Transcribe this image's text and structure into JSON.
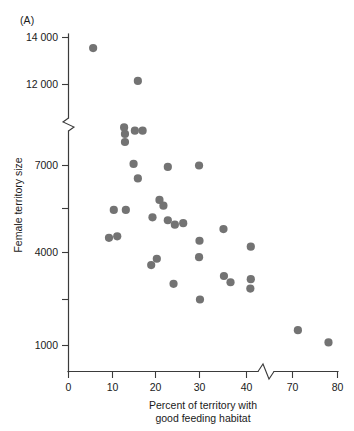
{
  "figure": {
    "panel_label": "(A)",
    "background_color": "#ffffff",
    "point_color": "#737373",
    "axis_color": "#3b3b3b"
  },
  "chart_data": {
    "type": "scatter",
    "title": "",
    "panel": "(A)",
    "xlabel": "Percent of territory with good feeding habitat",
    "xlabel_line1": "Percent of territory with",
    "xlabel_line2": "good feeding habitat",
    "ylabel": "Female territory size",
    "xlim": [
      0,
      80
    ],
    "ylim": [
      1000,
      14000
    ],
    "grid": false,
    "legend": null,
    "x_ticks": [
      0,
      10,
      20,
      30,
      40,
      70,
      80
    ],
    "x_tick_labels": [
      "0",
      "10",
      "20",
      "30",
      "40",
      "70",
      "80"
    ],
    "y_ticks": [
      1000,
      4000,
      7000,
      12000,
      14000
    ],
    "y_tick_labels": [
      "1000",
      "4000",
      "7000",
      "12 000",
      "14 000"
    ],
    "y_minor_ticks": [
      2500,
      5500
    ],
    "axis_break_x": {
      "between": [
        40,
        70
      ],
      "at": 45
    },
    "axis_break_y": {
      "between": [
        7000,
        12000
      ],
      "at": 9500
    },
    "marker": "circle",
    "marker_size": 5.2,
    "points": [
      {
        "x": 5.6,
        "y": 13550
      },
      {
        "x": 15.9,
        "y": 12150
      },
      {
        "x": 12.7,
        "y": 9350
      },
      {
        "x": 12.9,
        "y": 8950
      },
      {
        "x": 15.2,
        "y": 9150
      },
      {
        "x": 17.0,
        "y": 9150
      },
      {
        "x": 12.9,
        "y": 8450
      },
      {
        "x": 14.9,
        "y": 7100
      },
      {
        "x": 15.9,
        "y": 6550
      },
      {
        "x": 22.8,
        "y": 6950
      },
      {
        "x": 29.9,
        "y": 7000
      },
      {
        "x": 20.9,
        "y": 5800
      },
      {
        "x": 21.8,
        "y": 5600
      },
      {
        "x": 22.8,
        "y": 5100
      },
      {
        "x": 24.4,
        "y": 4950
      },
      {
        "x": 26.3,
        "y": 5000
      },
      {
        "x": 19.3,
        "y": 5200
      },
      {
        "x": 10.3,
        "y": 5450
      },
      {
        "x": 13.1,
        "y": 5450
      },
      {
        "x": 35.1,
        "y": 4800
      },
      {
        "x": 9.2,
        "y": 4500
      },
      {
        "x": 11.1,
        "y": 4550
      },
      {
        "x": 30.0,
        "y": 4400
      },
      {
        "x": 19.0,
        "y": 3600
      },
      {
        "x": 20.3,
        "y": 3800
      },
      {
        "x": 29.9,
        "y": 3850
      },
      {
        "x": 42.8,
        "y": 4200
      },
      {
        "x": 35.2,
        "y": 3250
      },
      {
        "x": 24.1,
        "y": 3000
      },
      {
        "x": 36.6,
        "y": 3050
      },
      {
        "x": 42.8,
        "y": 3150
      },
      {
        "x": 42.5,
        "y": 2850
      },
      {
        "x": 30.1,
        "y": 2500
      },
      {
        "x": 71.2,
        "y": 1500
      },
      {
        "x": 78.0,
        "y": 1100
      }
    ]
  },
  "axes": {
    "y_axis_title": "Female territory size",
    "x_axis_title_line1": "Percent of territory with",
    "x_axis_title_line2": "good feeding habitat"
  }
}
